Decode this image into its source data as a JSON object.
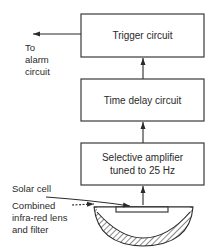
{
  "blocks": {
    "trigger": {
      "label": "Trigger circuit"
    },
    "time_delay": {
      "label": "Time delay circuit"
    },
    "amplifier": {
      "line1": "Selective amplifier",
      "line2": "tuned to 25 Hz"
    }
  },
  "labels": {
    "output": {
      "line1": "To",
      "line2": "alarm",
      "line3": "circuit"
    },
    "solar_cell": "Solar cell",
    "lens": {
      "line1": "Combined",
      "line2": "infra-red lens",
      "line3": "and filter"
    }
  },
  "colors": {
    "line": "#2a2a2a",
    "background": "#ffffff"
  }
}
